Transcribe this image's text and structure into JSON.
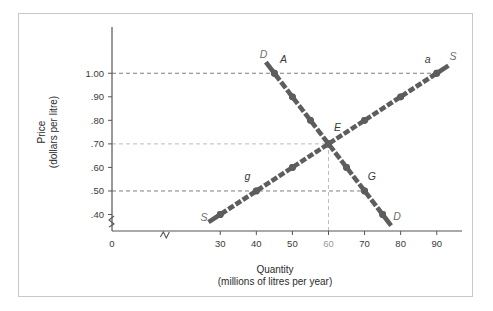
{
  "figure": {
    "top_caption": "",
    "background_color": "#ffffff",
    "frame_color": "#c8c8c8"
  },
  "chart_data": {
    "type": "line",
    "title": "",
    "xlabel": "Quantity",
    "xlabel_sub": "(millions of litres per year)",
    "ylabel": "Price",
    "ylabel_sub": "(dollars per litre)",
    "xlim": [
      0,
      97
    ],
    "ylim": [
      0.33,
      1.12
    ],
    "grid": false,
    "axis_break_x": true,
    "axis_break_y": true,
    "xticks": [
      0,
      30,
      40,
      50,
      60,
      70,
      80,
      90
    ],
    "xticklabels": [
      "0",
      "30",
      "40",
      "50",
      "60",
      "70",
      "80",
      "90"
    ],
    "xtick_muted": [
      "60"
    ],
    "yticks": [
      0.4,
      0.5,
      0.6,
      0.7,
      0.8,
      0.9,
      1.0
    ],
    "yticklabels": [
      ".40",
      ".50",
      ".60",
      ".70",
      ".80",
      ".90",
      "1.00"
    ],
    "series": [
      {
        "name": "Demand",
        "label": "D",
        "color": "#5d5d5d",
        "x": [
          45,
          50,
          55,
          60,
          65,
          70,
          75
        ],
        "y": [
          1.0,
          0.9,
          0.8,
          0.7,
          0.6,
          0.5,
          0.4
        ]
      },
      {
        "name": "Supply",
        "label": "S",
        "color": "#5d5d5d",
        "x": [
          30,
          40,
          50,
          60,
          70,
          80,
          90
        ],
        "y": [
          0.4,
          0.5,
          0.6,
          0.7,
          0.8,
          0.9,
          1.0
        ]
      }
    ],
    "annotations": [
      {
        "text": "D",
        "x": 42.0,
        "y": 1.065,
        "kind": "curve-end",
        "series": "Demand"
      },
      {
        "text": "D",
        "x": 79.0,
        "y": 0.375,
        "kind": "curve-end",
        "series": "Demand"
      },
      {
        "text": "S",
        "x": 25.5,
        "y": 0.372,
        "kind": "curve-end",
        "series": "Supply"
      },
      {
        "text": "S",
        "x": 94.5,
        "y": 1.055,
        "kind": "curve-end",
        "series": "Supply"
      },
      {
        "text": "A",
        "x": 47.5,
        "y": 1.045,
        "kind": "point",
        "point_x": 45,
        "point_y": 1.0
      },
      {
        "text": "a",
        "x": 87.5,
        "y": 1.045,
        "kind": "point",
        "point_x": 90,
        "point_y": 1.0
      },
      {
        "text": "E",
        "x": 62.5,
        "y": 0.755,
        "kind": "point",
        "point_x": 60,
        "point_y": 0.7
      },
      {
        "text": "g",
        "x": 37.5,
        "y": 0.545,
        "kind": "point",
        "point_x": 40,
        "point_y": 0.5
      },
      {
        "text": "G",
        "x": 72.0,
        "y": 0.548,
        "kind": "point",
        "point_x": 70,
        "point_y": 0.5
      }
    ],
    "reference_lines": [
      {
        "orientation": "horizontal",
        "value": 1.0,
        "from": 0,
        "to": 90,
        "color": "#6f6f6f"
      },
      {
        "orientation": "horizontal",
        "value": 0.7,
        "from": 0,
        "to": 60,
        "color": "#b4b4b4"
      },
      {
        "orientation": "horizontal",
        "value": 0.5,
        "from": 0,
        "to": 70,
        "color": "#6f6f6f"
      },
      {
        "orientation": "vertical",
        "value": 60,
        "from": 0.33,
        "to": 0.7,
        "color": "#b4b4b4"
      }
    ]
  }
}
